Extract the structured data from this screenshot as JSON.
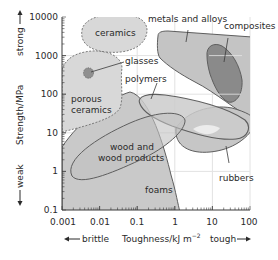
{
  "chart_data": {
    "type": "scatter",
    "subtype": "material-property-region-map",
    "title": "",
    "xlabel": "Toughness/kJ m⁻²",
    "ylabel": "Strength/MPa",
    "x_scale": "log",
    "y_scale": "log",
    "xlim": [
      0.001,
      100
    ],
    "ylim": [
      0.1,
      10000
    ],
    "x_ticks": [
      "0.001",
      "0.01",
      "0.1",
      "1",
      "10",
      "100"
    ],
    "y_ticks": [
      "0.1",
      "1",
      "10",
      "100",
      "1000",
      "10000"
    ],
    "grid": true,
    "x_direction_labels": {
      "left": "brittle",
      "right": "tough"
    },
    "y_direction_labels": {
      "bottom": "weak",
      "top": "strong"
    },
    "regions": [
      {
        "name": "ceramics",
        "toughness_range": [
          0.008,
          0.6
        ],
        "strength_range": [
          1000,
          10000
        ],
        "style": "dashed"
      },
      {
        "name": "glasses",
        "toughness_range": [
          0.004,
          0.007
        ],
        "strength_range": [
          200,
          500
        ],
        "style": "dashed"
      },
      {
        "name": "porous ceramics",
        "toughness_range": [
          0.001,
          0.1
        ],
        "strength_range": [
          10,
          2000
        ],
        "style": "dashed"
      },
      {
        "name": "metals and alloys",
        "toughness_range": [
          0.7,
          100
        ],
        "strength_range": [
          10,
          3500
        ],
        "style": "solid"
      },
      {
        "name": "composites",
        "toughness_range": [
          7,
          60
        ],
        "strength_range": [
          80,
          2000
        ],
        "style": "solid"
      },
      {
        "name": "polymers",
        "toughness_range": [
          0.3,
          70
        ],
        "strength_range": [
          2,
          100
        ],
        "style": "solid"
      },
      {
        "name": "rubbers",
        "toughness_range": [
          1,
          100
        ],
        "strength_range": [
          1.5,
          30
        ],
        "style": "solid"
      },
      {
        "name": "wood and wood products",
        "toughness_range": [
          0.0012,
          2
        ],
        "strength_range": [
          0.4,
          80
        ],
        "style": "solid"
      },
      {
        "name": "foams",
        "toughness_range": [
          0.001,
          5
        ],
        "strength_range": [
          0.1,
          30
        ],
        "style": "solid"
      }
    ]
  },
  "labels": {
    "ceramics": "ceramics",
    "glasses": "glasses",
    "porous1": "porous",
    "porous2": "ceramics",
    "metals": "metals and alloys",
    "composites": "composites",
    "polymers": "polymers",
    "rubbers": "rubbers",
    "wood1": "wood and",
    "wood2": "wood products",
    "foams": "foams"
  },
  "axes": {
    "x_ticks": [
      "0.001",
      "0.01",
      "0.1",
      "1",
      "10",
      "100"
    ],
    "y_ticks": [
      "0.1",
      "1",
      "10",
      "100",
      "1000",
      "10000"
    ],
    "xlabel": "Toughness/kJ m",
    "xlabel_sup": "−2",
    "ylabel": "Strength/MPa",
    "brittle": "brittle",
    "tough": "tough",
    "weak": "weak",
    "strong": "strong"
  },
  "colors": {
    "region_fill": "#c8c8c8",
    "region_stroke": "#5a5a5a",
    "composite_fill": "#8c8c8c",
    "glass_fill": "#8f8f8f",
    "grid": "#e0e0e0",
    "background": "#ffffff"
  }
}
